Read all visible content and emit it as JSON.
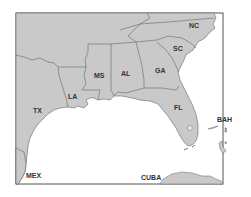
{
  "map": {
    "title": "Southeastern United States",
    "colors": {
      "land": "#c9c9c9",
      "water": "#ffffff",
      "border": "#666666",
      "frame": "#555555"
    },
    "labels": {
      "nc": "NC",
      "sc": "SC",
      "ga": "GA",
      "al": "AL",
      "ms": "MS",
      "la": "LA",
      "tx": "TX",
      "fl": "FL",
      "bah": "BAH",
      "mex": "MEX",
      "cuba": "CUBA"
    }
  }
}
